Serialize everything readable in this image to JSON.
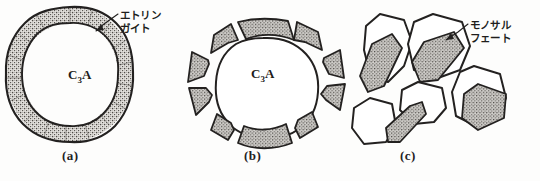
{
  "figure": {
    "background_color": "#fdfdfc",
    "ink_color": "#23211f",
    "hatch_color": "#6f6c68"
  },
  "panels": [
    {
      "id": "a",
      "caption": "(a)",
      "core_label_main": "C",
      "core_label_sub": "3",
      "core_label_tail": "A",
      "annotation": {
        "name": "ettringite-label",
        "line1": "エトリン",
        "line2": "ガイト"
      }
    },
    {
      "id": "b",
      "caption": "(b)",
      "core_label_main": "C",
      "core_label_sub": "3",
      "core_label_tail": "A",
      "annotation": null
    },
    {
      "id": "c",
      "caption": "(c)",
      "core_label_main": "",
      "core_label_sub": "",
      "core_label_tail": "",
      "annotation": {
        "name": "monosulfate-label",
        "line1": "モノサル",
        "line2": "フェート"
      }
    }
  ],
  "icons": {
    "leader_line": "leader-line-icon",
    "hatched_shell": "hatched-shell-icon",
    "hatched_crystal": "hatched-crystal-icon",
    "grain_polygon": "grain-polygon-icon"
  }
}
